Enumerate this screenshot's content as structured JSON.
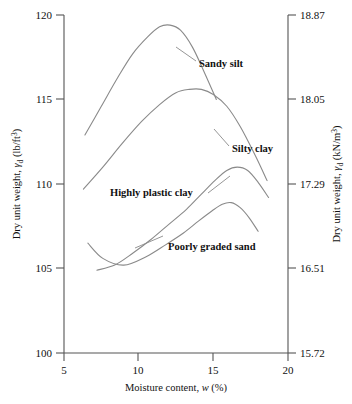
{
  "chart_data": {
    "type": "line",
    "title": "",
    "xlabel": "Moisture content, w (%)",
    "ylabel": "Dry unit weight, γd (lb/ft3)",
    "ylabel_right": "Dry unit weight, γd (kN/m3)",
    "xlim": [
      5,
      20
    ],
    "ylim": [
      100,
      120
    ],
    "grid": false,
    "legend_position": "inline-annotations",
    "xticks": [
      "5",
      "10",
      "15",
      "20"
    ],
    "xtick_values": [
      5,
      10,
      15,
      20
    ],
    "yticks": [
      "100",
      "105",
      "110",
      "115",
      "120"
    ],
    "ytick_values": [
      100,
      105,
      110,
      115,
      120
    ],
    "yticks_right": [
      "15.72",
      "16.51",
      "17.29",
      "18.05",
      "18.87"
    ],
    "ytick_values_right": [
      15.72,
      16.51,
      17.29,
      18.05,
      18.87
    ],
    "series": [
      {
        "name": "Sandy silt",
        "x": [
          6.4,
          7.5,
          8.6,
          9.6,
          10.6,
          11.4,
          12.1,
          12.8,
          13.6,
          14.4,
          15.2
        ],
        "values": [
          112.9,
          114.6,
          116.3,
          117.7,
          118.7,
          119.3,
          119.4,
          119.1,
          118.1,
          116.6,
          115.0
        ]
      },
      {
        "name": "Silty clay",
        "x": [
          6.3,
          7.6,
          8.9,
          10.2,
          11.4,
          12.5,
          13.4,
          14.2,
          15.0,
          15.9,
          16.8,
          17.8,
          18.6
        ],
        "values": [
          109.7,
          111.0,
          112.4,
          113.7,
          114.7,
          115.4,
          115.6,
          115.6,
          115.3,
          114.6,
          113.4,
          111.7,
          110.2
        ]
      },
      {
        "name": "Highly plastic clay",
        "x": [
          7.2,
          8.4,
          9.6,
          10.8,
          12.0,
          13.2,
          14.2,
          15.1,
          15.9,
          16.6,
          17.3,
          18.0,
          18.7
        ],
        "values": [
          104.9,
          105.2,
          105.9,
          106.7,
          107.6,
          108.5,
          109.4,
          110.2,
          110.8,
          111.0,
          110.8,
          110.1,
          109.2
        ]
      },
      {
        "name": "Poorly graded sand",
        "x": [
          6.6,
          7.6,
          9.0,
          10.5,
          11.8,
          13.0,
          14.0,
          14.9,
          15.6,
          16.2,
          16.8,
          17.4,
          18.0
        ],
        "values": [
          106.5,
          105.6,
          105.2,
          105.7,
          106.4,
          107.1,
          107.8,
          108.4,
          108.8,
          108.9,
          108.6,
          108.0,
          107.2
        ]
      }
    ],
    "annotations": [
      {
        "label": "Sandy silt",
        "x_px": 199,
        "y_px": 63
      },
      {
        "label": "Silty clay",
        "x_px": 232,
        "y_px": 148
      },
      {
        "label": "Highly plastic clay",
        "x_px": 110,
        "y_px": 192
      },
      {
        "label": "Poorly graded sand",
        "x_px": 168,
        "y_px": 246
      }
    ],
    "axis_symbols": {
      "gamma": "γ",
      "sub_d": "d",
      "unit_left": "lb/ft",
      "unit_left_exp": "3",
      "unit_right": "kN/m",
      "unit_right_exp": "3",
      "w_italic": "w",
      "percent": "(%)"
    },
    "colors": {
      "curve": "#8a8a8a",
      "axis": "#555555",
      "text": "#111111",
      "background": "#ffffff"
    }
  }
}
